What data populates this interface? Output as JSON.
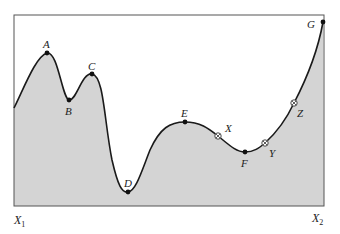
{
  "diagram": {
    "type": "fitness-landscape",
    "fill_color": "#d4d4d4",
    "curve_color": "#1a1a1a",
    "frame_color": "#555555",
    "axis_labels": {
      "left": {
        "base": "X",
        "sub": "1"
      },
      "right": {
        "base": "X",
        "sub": "2"
      }
    },
    "solid_points": [
      {
        "label": "A",
        "x": 47,
        "y": 53
      },
      {
        "label": "B",
        "x": 69,
        "y": 100
      },
      {
        "label": "C",
        "x": 92,
        "y": 74
      },
      {
        "label": "D",
        "x": 128,
        "y": 192
      },
      {
        "label": "E",
        "x": 185,
        "y": 122
      },
      {
        "label": "F",
        "x": 245,
        "y": 152
      },
      {
        "label": "G",
        "x": 323,
        "y": 22
      }
    ],
    "open_points": [
      {
        "label": "X",
        "x": 218,
        "y": 136
      },
      {
        "label": "Y",
        "x": 265,
        "y": 143
      },
      {
        "label": "Z",
        "x": 294,
        "y": 103
      }
    ]
  }
}
